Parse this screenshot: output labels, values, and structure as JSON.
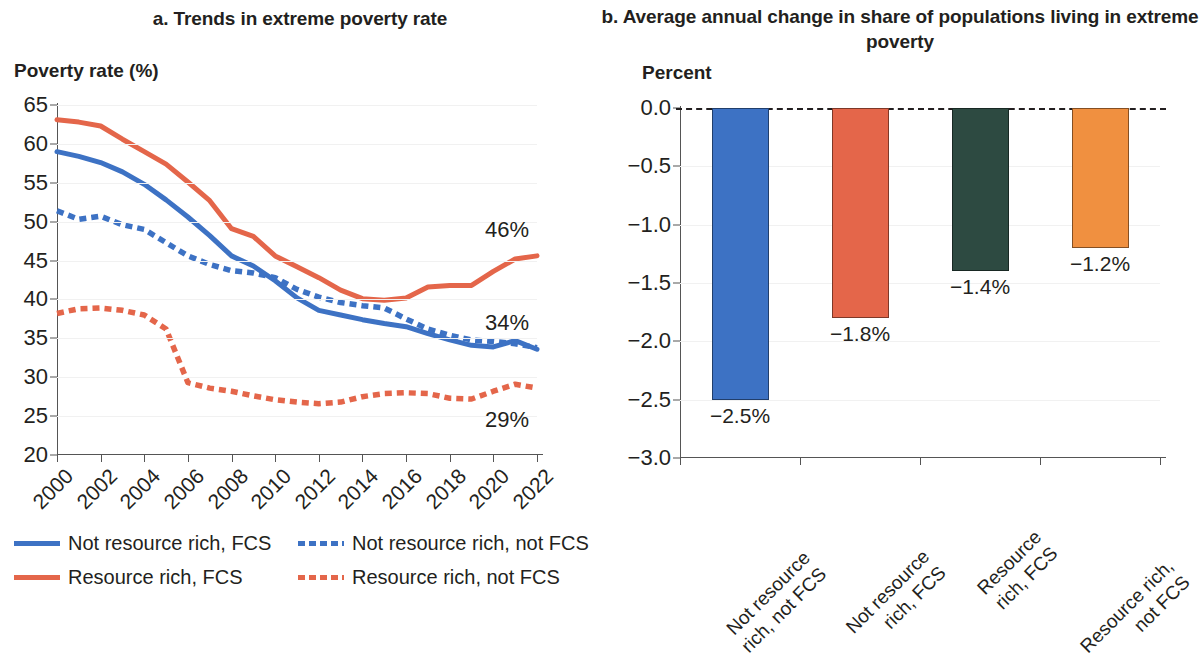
{
  "colors": {
    "blue": "#3d72c4",
    "red": "#e4664a",
    "green": "#2d4a41",
    "orange": "#f09040",
    "text": "#231f20",
    "axis": "#555555",
    "grid": "#f1f1f1"
  },
  "panel_a": {
    "title": "a. Trends in extreme poverty rate",
    "axis_caption": "Poverty rate (%)",
    "end_labels": {
      "red_solid": "46%",
      "blue_solid": "34%",
      "red_dashed": "29%"
    },
    "legend": [
      {
        "label": "Not resource rich, FCS",
        "color": "#3d72c4",
        "style": "solid"
      },
      {
        "label": "Not resource rich, not FCS",
        "color": "#3d72c4",
        "style": "dashed"
      },
      {
        "label": "Resource rich, FCS",
        "color": "#e4664a",
        "style": "solid"
      },
      {
        "label": "Resource rich, not FCS",
        "color": "#e4664a",
        "style": "dashed"
      }
    ]
  },
  "panel_b": {
    "title": "b. Average annual change in share of populations living in extreme poverty",
    "axis_caption": "Percent"
  },
  "chart_data": [
    {
      "type": "line",
      "title": "a. Trends in extreme poverty rate",
      "xlabel": "",
      "ylabel": "Poverty rate (%)",
      "ylim": [
        20,
        65
      ],
      "ytick_labels": [
        "20",
        "25",
        "30",
        "35",
        "40",
        "45",
        "50",
        "55",
        "60",
        "65"
      ],
      "yticks": [
        20,
        25,
        30,
        35,
        40,
        45,
        50,
        55,
        60,
        65
      ],
      "xlim": [
        2000,
        2022
      ],
      "xticks": [
        2000,
        2002,
        2004,
        2006,
        2008,
        2010,
        2012,
        2014,
        2016,
        2018,
        2020,
        2022
      ],
      "xtick_labels": [
        "2000",
        "2002",
        "2004",
        "2006",
        "2008",
        "2010",
        "2012",
        "2014",
        "2016",
        "2018",
        "2020",
        "2022"
      ],
      "x": [
        2000,
        2001,
        2002,
        2003,
        2004,
        2005,
        2006,
        2007,
        2008,
        2009,
        2010,
        2011,
        2012,
        2013,
        2014,
        2015,
        2016,
        2017,
        2018,
        2019,
        2020,
        2021,
        2022
      ],
      "grid": true,
      "legend_position": "bottom",
      "series": [
        {
          "name": "Not resource rich, FCS",
          "color": "#3d72c4",
          "style": "solid",
          "end_label": "34%",
          "values": [
            59.0,
            58.4,
            57.6,
            56.4,
            54.8,
            52.8,
            50.6,
            48.2,
            45.6,
            44.3,
            42.4,
            40.2,
            38.6,
            38.0,
            37.4,
            36.9,
            36.5,
            35.6,
            34.8,
            34.1,
            33.9,
            34.7,
            33.6
          ]
        },
        {
          "name": "Not resource rich, not FCS",
          "color": "#3d72c4",
          "style": "dashed",
          "end_label": "",
          "values": [
            51.4,
            50.3,
            50.7,
            49.6,
            49.0,
            47.3,
            45.6,
            44.5,
            43.7,
            43.4,
            42.8,
            41.3,
            40.3,
            39.6,
            39.2,
            38.9,
            37.5,
            36.2,
            35.4,
            34.8,
            34.6,
            34.3,
            33.8
          ]
        },
        {
          "name": "Resource rich, FCS",
          "color": "#e4664a",
          "style": "solid",
          "end_label": "46%",
          "values": [
            63.1,
            62.8,
            62.3,
            60.6,
            59.0,
            57.4,
            55.1,
            52.7,
            49.1,
            48.1,
            45.6,
            44.2,
            42.8,
            41.2,
            40.1,
            39.9,
            40.2,
            41.6,
            41.8,
            41.8,
            43.6,
            45.2,
            45.6
          ]
        },
        {
          "name": "Resource rich, not FCS",
          "color": "#e4664a",
          "style": "dashed",
          "end_label": "29%",
          "values": [
            38.2,
            38.8,
            38.9,
            38.6,
            38.0,
            36.2,
            29.3,
            28.6,
            28.2,
            27.6,
            27.1,
            26.8,
            26.6,
            26.8,
            27.5,
            27.9,
            28.0,
            27.9,
            27.3,
            27.2,
            28.2,
            29.1,
            28.6
          ]
        }
      ]
    },
    {
      "type": "bar",
      "title": "b. Average annual change in share of populations living in extreme poverty",
      "xlabel": "",
      "ylabel": "Percent",
      "ylim": [
        -3.0,
        0.0
      ],
      "yticks": [
        0.0,
        -0.5,
        -1.0,
        -1.5,
        -2.0,
        -2.5,
        -3.0
      ],
      "ytick_labels": [
        "0.0",
        "−0.5",
        "−1.0",
        "−1.5",
        "−2.0",
        "−2.5",
        "−3.0"
      ],
      "categories": [
        "Not resource rich, not FCS",
        "Not resource rich, FCS",
        "Resource rich, FCS",
        "Resource rich, not FCS"
      ],
      "category_lines": [
        [
          "Not resource",
          "rich, not FCS"
        ],
        [
          "Not resource",
          "rich, FCS"
        ],
        [
          "Resource",
          "rich, FCS"
        ],
        [
          "Resource rich,",
          "not FCS"
        ]
      ],
      "values": [
        -2.5,
        -1.8,
        -1.4,
        -1.2
      ],
      "value_labels": [
        "−2.5%",
        "−1.8%",
        "−1.4%",
        "−1.2%"
      ],
      "colors": [
        "#3d72c4",
        "#e4664a",
        "#2d4a41",
        "#f09040"
      ],
      "grid": true,
      "zero_line": "dashed"
    }
  ]
}
